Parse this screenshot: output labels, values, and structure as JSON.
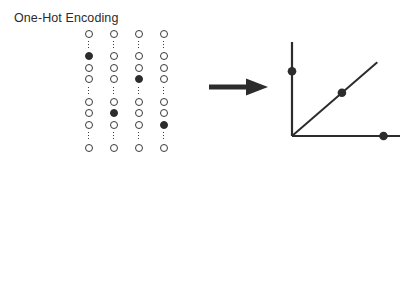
{
  "figure": {
    "background_color": "#ffffff",
    "ink_color": "#2c2c2c"
  },
  "sections": [
    {
      "id": "one-hot",
      "title": "One-Hot Encoding",
      "arrow_name": "arrow-right-icon",
      "columns": [
        {
          "label": "one-hot-column-1",
          "slots": [
            "circle",
            "gap",
            "filled",
            "circle",
            "circle",
            "gap",
            "circle",
            "circle",
            "circle",
            "gap",
            "circle"
          ]
        },
        {
          "label": "one-hot-column-2",
          "slots": [
            "circle",
            "gap",
            "circle",
            "circle",
            "circle",
            "gap",
            "circle",
            "filled",
            "circle",
            "gap",
            "circle"
          ]
        },
        {
          "label": "one-hot-column-3",
          "slots": [
            "circle",
            "gap",
            "circle",
            "circle",
            "filled",
            "gap",
            "circle",
            "circle",
            "circle",
            "gap",
            "circle"
          ]
        },
        {
          "label": "one-hot-column-4",
          "slots": [
            "circle",
            "gap",
            "circle",
            "circle",
            "circle",
            "gap",
            "circle",
            "circle",
            "filled",
            "gap",
            "circle"
          ]
        }
      ]
    },
    {
      "id": "dense",
      "title": "Dense Encoding",
      "arrow_name": "arrow-right-icon",
      "columns": [
        {
          "label": "dense-column-1",
          "shades": [
            "#d6d6d6",
            "#808080",
            "#ffffff",
            "#b4b4b4",
            "#6e6e6e",
            "#949494",
            "#4f4f4f"
          ]
        },
        {
          "label": "dense-column-2",
          "shades": [
            "#c2c2c2",
            "#4f4f4f",
            "#909090",
            "#ffffff",
            "#ffffff",
            "#848484",
            "#a8a8a8"
          ]
        },
        {
          "label": "dense-column-3",
          "shades": [
            "#6e6e6e",
            "#3d3d3d",
            "#e0e0e0",
            "#c2c2c2",
            "#a0a0a0",
            "#8a8a8a",
            "#f0f0f0"
          ]
        },
        {
          "label": "dense-column-4",
          "shades": [
            "#8c8c8c",
            "#ffffff",
            "#c2c2c2",
            "#3d3d3d",
            "#4f4f4f",
            "#ffffff",
            "#b4b4b4"
          ]
        }
      ]
    }
  ],
  "chart_data": [
    {
      "id": "one-hot-plot",
      "type": "scatter",
      "title": "",
      "xlabel": "",
      "ylabel": "",
      "xlim": [
        0,
        100
      ],
      "ylim": [
        0,
        100
      ],
      "grid": false,
      "legend": null,
      "axes": {
        "y_axis": true,
        "x_axis": true,
        "diagonal_line": true
      },
      "annotation": "Points lie only on the axes or on the unit diagonal",
      "points": [
        {
          "x": 0,
          "y": 72
        },
        {
          "x": 48,
          "y": 48
        },
        {
          "x": 88,
          "y": 0
        }
      ]
    },
    {
      "id": "dense-plot",
      "type": "scatter",
      "title": "",
      "xlabel": "",
      "ylabel": "",
      "xlim": [
        0,
        100
      ],
      "ylim": [
        0,
        100
      ],
      "grid": false,
      "legend": null,
      "axes": {
        "y_axis": false,
        "x_axis": true,
        "diagonal_line": true
      },
      "annotation": "Points fill the region beneath the diagonal",
      "points": [
        {
          "x": 21,
          "y": 21
        },
        {
          "x": 35,
          "y": 30
        },
        {
          "x": 46,
          "y": 18
        },
        {
          "x": 48,
          "y": 52
        },
        {
          "x": 57,
          "y": 60
        },
        {
          "x": 62,
          "y": 34
        },
        {
          "x": 64,
          "y": 24
        },
        {
          "x": 68,
          "y": 37
        },
        {
          "x": 69,
          "y": 10
        },
        {
          "x": 72,
          "y": 72
        },
        {
          "x": 81,
          "y": 87
        },
        {
          "x": 88,
          "y": 86
        },
        {
          "x": 87,
          "y": 57
        },
        {
          "x": 89,
          "y": 11
        }
      ]
    }
  ]
}
